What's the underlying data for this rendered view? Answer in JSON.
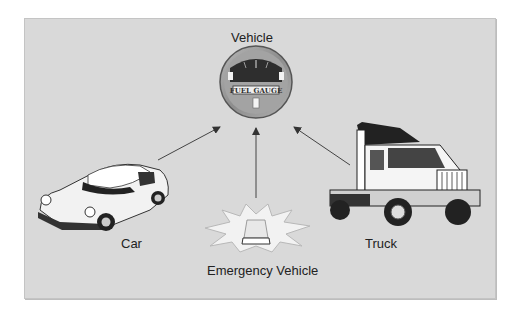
{
  "diagram": {
    "center": {
      "label": "Vehicle",
      "icon": "fuel-gauge-icon",
      "gauge_text": "FUEL GAUGE"
    },
    "children": [
      {
        "label": "Car",
        "icon": "car-icon"
      },
      {
        "label": "Emergency Vehicle",
        "icon": "emergency-light-icon"
      },
      {
        "label": "Truck",
        "icon": "truck-icon"
      }
    ],
    "relationship": "inheritance-arrows-to-center"
  },
  "colors": {
    "panel": "#d9d9d9",
    "text": "#222222",
    "gauge_ring": "#9a9a9a",
    "gauge_face": "#2e2e2e"
  }
}
